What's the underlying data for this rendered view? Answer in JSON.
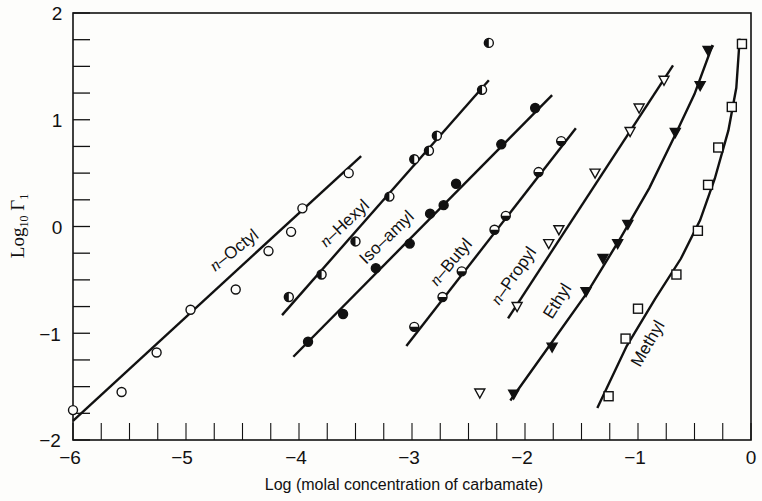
{
  "chart_data": {
    "type": "scatter",
    "title": "",
    "xlabel": "Log (molal concentration of carbamate)",
    "ylabel": "Log10 Γ1",
    "xlim": [
      -6,
      0
    ],
    "ylim": [
      -2,
      2
    ],
    "x_ticks": [
      "-6",
      "-5",
      "-4",
      "-3",
      "-2",
      "-1",
      "0"
    ],
    "y_ticks": [
      "-2",
      "-1",
      "0",
      "1",
      "2"
    ],
    "grid": false,
    "legend": "inline labels along lines",
    "series": [
      {
        "name": "n-Octyl",
        "marker": "open-circle",
        "x": [
          -6.0,
          -5.57,
          -5.26,
          -4.96,
          -4.56,
          -4.27,
          -4.07,
          -3.97,
          -3.56
        ],
        "y": [
          -1.72,
          -1.55,
          -1.18,
          -0.78,
          -0.59,
          -0.23,
          -0.05,
          0.17,
          0.5
        ],
        "fit_line": [
          [
            -6.0,
            -1.82
          ],
          [
            -3.45,
            0.66
          ]
        ]
      },
      {
        "name": "n-Hexyl",
        "marker": "half-filled-circle-left",
        "x": [
          -4.09,
          -3.8,
          -3.5,
          -3.2,
          -2.98,
          -2.85,
          -2.78,
          -2.38
        ],
        "y": [
          -0.66,
          -0.45,
          -0.14,
          0.28,
          0.63,
          0.71,
          0.85,
          1.28
        ],
        "fit_line": [
          [
            -4.15,
            -0.83
          ],
          [
            -2.32,
            1.37
          ]
        ]
      },
      {
        "name": "Iso-amyl",
        "marker": "filled-circle",
        "x": [
          -3.92,
          -3.61,
          -3.32,
          -3.02,
          -2.84,
          -2.72,
          -2.61,
          -2.21,
          -1.91
        ],
        "y": [
          -1.08,
          -0.82,
          -0.39,
          -0.16,
          0.12,
          0.2,
          0.4,
          0.77,
          1.11
        ],
        "fit_line": [
          [
            -4.05,
            -1.22
          ],
          [
            -1.76,
            1.23
          ]
        ]
      },
      {
        "name": "n-Butyl",
        "marker": "half-filled-circle-bottom",
        "x": [
          -2.98,
          -2.73,
          -2.56,
          -2.27,
          -2.17,
          -1.88,
          -1.68
        ],
        "y": [
          -0.94,
          -0.66,
          -0.42,
          -0.03,
          0.1,
          0.51,
          0.8
        ],
        "fit_line": [
          [
            -3.05,
            -1.12
          ],
          [
            -1.55,
            0.92
          ]
        ]
      },
      {
        "name": "n-Propyl",
        "marker": "open-triangle-down",
        "x": [
          -2.07,
          -1.79,
          -1.7,
          -1.38,
          -1.07,
          -0.99,
          -0.77,
          -2.4
        ],
        "y": [
          -0.75,
          -0.16,
          -0.03,
          0.5,
          0.89,
          1.11,
          1.37,
          -1.56
        ],
        "fit_line": [
          [
            -2.15,
            -0.86
          ],
          [
            -0.69,
            1.51
          ]
        ]
      },
      {
        "name": "Ethyl",
        "marker": "filled-triangle-down",
        "x": [
          -2.1,
          -1.76,
          -1.46,
          -1.31,
          -1.18,
          -1.09,
          -0.67,
          -0.45,
          -0.38
        ],
        "y": [
          -1.57,
          -1.13,
          -0.61,
          -0.3,
          -0.16,
          0.02,
          0.88,
          1.32,
          1.65
        ],
        "fit_line": "curve from (-2.13,-1.63) to (-0.34,1.70)"
      },
      {
        "name": "Methyl",
        "marker": "open-square",
        "x": [
          -1.26,
          -1.11,
          -1.0,
          -0.66,
          -0.47,
          -0.38,
          -0.29,
          -0.17,
          -0.08
        ],
        "y": [
          -1.59,
          -1.05,
          -0.77,
          -0.45,
          -0.04,
          0.39,
          0.74,
          1.12,
          1.71
        ],
        "fit_line": "curve from (-1.36,-1.70) to (-0.10,1.76)"
      },
      {
        "name": "outlier (half-filled)",
        "marker": "half-filled-circle-left",
        "x": [
          -2.32
        ],
        "y": [
          1.72
        ]
      }
    ]
  },
  "labels": {
    "x_axis_title": "Log (molal concentration of carbamate)",
    "y_axis_prefix": "Log",
    "y_axis_sub": "10",
    "y_axis_symbol": "Γ",
    "y_axis_sub2": "1",
    "x_ticks": [
      "−6",
      "−5",
      "−4",
      "−3",
      "−2",
      "−1",
      "0"
    ],
    "y_ticks": [
      "2",
      "1",
      "0",
      "−1",
      "−2"
    ],
    "series": {
      "octyl": {
        "italic": "n",
        "rest": "–Octyl"
      },
      "hexyl": {
        "italic": "n",
        "rest": "–Hexyl"
      },
      "isoamyl": "Iso–amyl",
      "butyl": {
        "italic": "n",
        "rest": "–Butyl"
      },
      "propyl": {
        "italic": "n",
        "rest": "–Propyl"
      },
      "ethyl": "Ethyl",
      "methyl": "Methyl"
    }
  }
}
